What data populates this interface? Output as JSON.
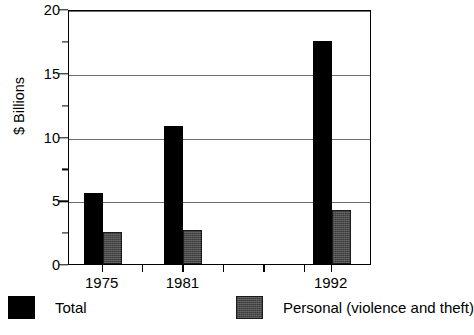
{
  "chart_data": {
    "type": "bar",
    "title": "",
    "xlabel": "",
    "ylabel": "$ Billions",
    "categories": [
      "1975",
      "1981",
      "1992"
    ],
    "x": [
      1975,
      1981,
      1992
    ],
    "series": [
      {
        "name": "Total",
        "values": [
          5.6,
          10.8,
          17.5
        ],
        "color": "#000000"
      },
      {
        "name": "Personal (violence and theft)",
        "values": [
          2.5,
          2.7,
          4.2
        ],
        "color": "#4a4a4a"
      }
    ],
    "ylim": [
      0,
      20
    ],
    "yticks": [
      0,
      5,
      10,
      15,
      20
    ],
    "ytick_labels": [
      "0",
      "5",
      "10",
      "15",
      "20"
    ],
    "yminor_ticks": [
      2.5,
      7.5,
      12.5,
      17.5
    ],
    "xlim": [
      1972.5,
      1995.0
    ],
    "xticks": [
      1975,
      1978,
      1981,
      1984,
      1987,
      1990,
      1992
    ],
    "xtick_labels": [
      "1975",
      "1981",
      "1992"
    ],
    "grid": "horizontal",
    "legend_position": "bottom"
  },
  "legend": {
    "items": [
      {
        "label": "Total",
        "swatch": "black-square-swatch"
      },
      {
        "label": "Personal (violence and theft)",
        "swatch": "gray-square-swatch"
      }
    ]
  },
  "axis": {
    "y_title": "$ Billions"
  }
}
